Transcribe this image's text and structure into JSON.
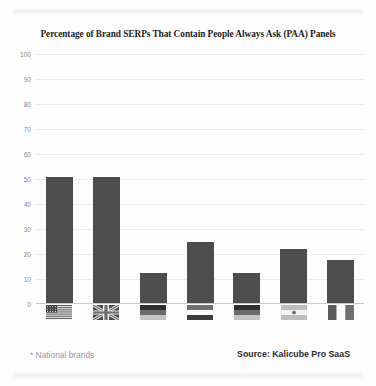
{
  "chart_data": {
    "type": "bar",
    "title": "Percentage of Brand SERPs That Contain People Always Ask (PAA) Panels",
    "xlabel": "",
    "ylabel": "",
    "ylim": [
      0,
      100
    ],
    "yticks": [
      100,
      90,
      80,
      70,
      60,
      50,
      40,
      30,
      20,
      10,
      0
    ],
    "grid": true,
    "legend": null,
    "categories": [
      "United States",
      "United Kingdom",
      "Germany",
      "Netherlands",
      "Germany",
      "Argentina",
      "France"
    ],
    "category_icons": [
      "flag-us-icon",
      "flag-uk-icon",
      "flag-de-icon",
      "flag-nl-icon",
      "flag-de2-icon",
      "flag-ar-icon",
      "flag-fr-icon"
    ],
    "values": [
      51,
      51,
      12.5,
      25,
      12.5,
      22,
      17.5
    ],
    "bar_color": "#4d4d4d",
    "gridline_color": "#ececec",
    "axis_color": "#c9c9c9"
  },
  "footer": {
    "footnote": "* National brands",
    "source": "Source: Kalicube Pro SaaS"
  }
}
